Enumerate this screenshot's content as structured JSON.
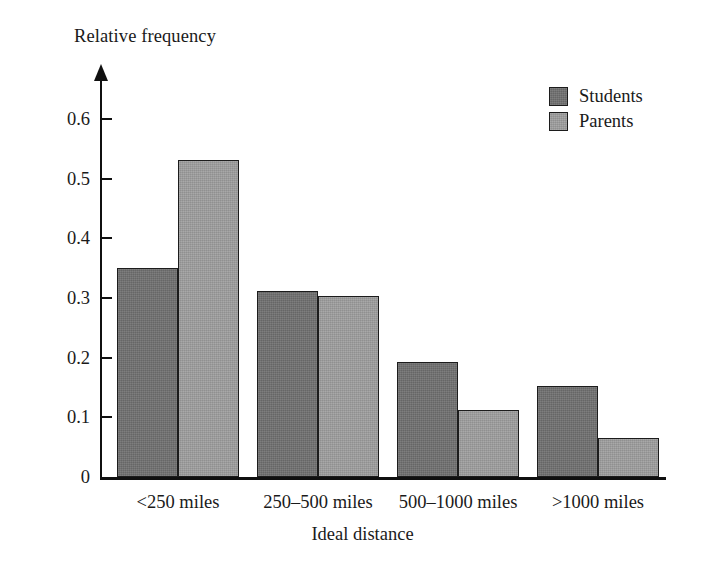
{
  "chart_data": {
    "type": "bar",
    "title": "",
    "subtitle": "",
    "xlabel": "Ideal distance",
    "ylabel": "Relative frequency",
    "categories": [
      "<250 miles",
      "250–500 miles",
      "500–1000 miles",
      ">1000 miles"
    ],
    "series": [
      {
        "name": "Students",
        "color": "#707070",
        "values": [
          0.35,
          0.312,
          0.193,
          0.153
        ]
      },
      {
        "name": "Parents",
        "color": "#9c9c9c",
        "values": [
          0.531,
          0.303,
          0.112,
          0.065
        ]
      }
    ],
    "ylim": [
      0,
      0.65
    ],
    "ytick_values": [
      0,
      0.1,
      0.2,
      0.3,
      0.4,
      0.5,
      0.6
    ],
    "ytick_labels": [
      "0",
      "0.1",
      "0.2",
      "0.3",
      "0.4",
      "0.5",
      "0.6"
    ],
    "grid": false,
    "legend_position": "top-right",
    "axis_color": "#101010",
    "background_color": "#ffffff",
    "y_axis_has_arrow": true
  },
  "legend": {
    "entries": [
      {
        "label": "Students"
      },
      {
        "label": "Parents"
      }
    ]
  }
}
